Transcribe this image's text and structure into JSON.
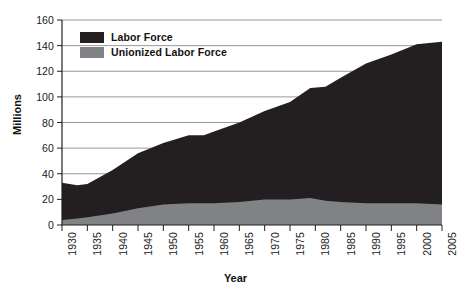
{
  "chart_data": {
    "type": "area",
    "title": "",
    "xlabel": "Year",
    "ylabel": "Millions",
    "xlim": [
      1930,
      2005
    ],
    "ylim": [
      0,
      160
    ],
    "ytick_step": 20,
    "yticks": [
      0,
      20,
      40,
      60,
      80,
      100,
      120,
      140,
      160
    ],
    "xticks": [
      1930,
      1935,
      1940,
      1945,
      1950,
      1955,
      1960,
      1965,
      1970,
      1975,
      1980,
      1985,
      1990,
      1995,
      2000,
      2005
    ],
    "grid": "horizontal",
    "legend_position": "top-left",
    "stacked": false,
    "colors": {
      "labor_force": "#231f20",
      "unionized": "#808285",
      "gridline": "#7f7f7f",
      "axis": "#231f20",
      "text": "#1a1a1a"
    },
    "x": [
      1930,
      1933,
      1935,
      1940,
      1945,
      1950,
      1955,
      1958,
      1960,
      1965,
      1970,
      1975,
      1979,
      1982,
      1985,
      1990,
      1995,
      2000,
      2005
    ],
    "series": [
      {
        "name": "Labor Force",
        "values": [
          33,
          31,
          32,
          43,
          56,
          64,
          70,
          70,
          73,
          80,
          89,
          96,
          107,
          108,
          115,
          126,
          133,
          141,
          143
        ]
      },
      {
        "name": "Unionized Labor Force",
        "values": [
          4,
          5,
          6,
          9,
          13,
          16,
          17,
          17,
          17,
          18,
          20,
          20,
          21,
          19,
          18,
          17,
          17,
          17,
          16
        ]
      }
    ]
  },
  "legend": {
    "items": [
      {
        "label": "Labor Force",
        "color": "#231f20"
      },
      {
        "label": "Unionized Labor Force",
        "color": "#808285"
      }
    ]
  },
  "axis_titles": {
    "x": "Year",
    "y": "Millions"
  }
}
